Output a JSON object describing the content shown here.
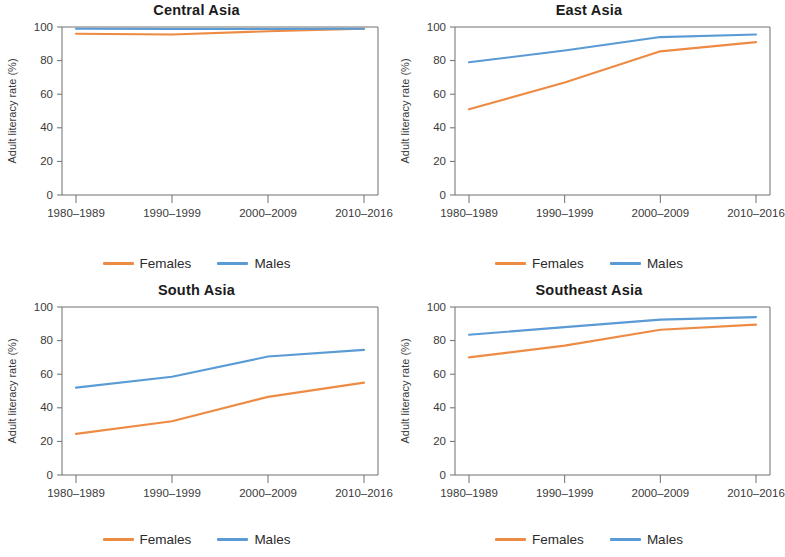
{
  "figure": {
    "y_axis_label": "Adult literacy rate (%)",
    "y_ticks": [
      "0",
      "20",
      "40",
      "60",
      "80",
      "100"
    ],
    "x_ticks": [
      "1980–1989",
      "1990–1999",
      "2000–2009",
      "2010–2016"
    ],
    "legend": {
      "females_label": "Females",
      "males_label": "Males"
    },
    "colors": {
      "females": "#ED8B44",
      "males": "#5A9BD5",
      "axis": "#6d6e71",
      "text": "#231f20",
      "background": "#ffffff"
    }
  },
  "chart_data": [
    {
      "type": "line",
      "title": "Central Asia",
      "xlabel": "",
      "ylabel": "Adult literacy rate (%)",
      "categories": [
        "1980–1989",
        "1990–1999",
        "2000–2009",
        "2010–2016"
      ],
      "ylim": [
        0,
        100
      ],
      "yticks": [
        0,
        20,
        40,
        60,
        80,
        100
      ],
      "grid": false,
      "legend_position": "bottom",
      "series": [
        {
          "name": "Females",
          "color": "#ED8B44",
          "values": [
            96,
            95.5,
            97.5,
            99
          ]
        },
        {
          "name": "Males",
          "color": "#5A9BD5",
          "values": [
            99,
            98.8,
            98.8,
            99
          ]
        }
      ]
    },
    {
      "type": "line",
      "title": "East Asia",
      "xlabel": "",
      "ylabel": "Adult literacy rate (%)",
      "categories": [
        "1980–1989",
        "1990–1999",
        "2000–2009",
        "2010–2016"
      ],
      "ylim": [
        0,
        100
      ],
      "yticks": [
        0,
        20,
        40,
        60,
        80,
        100
      ],
      "grid": false,
      "legend_position": "bottom",
      "series": [
        {
          "name": "Females",
          "color": "#ED8B44",
          "values": [
            51,
            67,
            85.5,
            91
          ]
        },
        {
          "name": "Males",
          "color": "#5A9BD5",
          "values": [
            79,
            86,
            94,
            95.5
          ]
        }
      ]
    },
    {
      "type": "line",
      "title": "South Asia",
      "xlabel": "",
      "ylabel": "Adult literacy rate (%)",
      "categories": [
        "1980–1989",
        "1990–1999",
        "2000–2009",
        "2010–2016"
      ],
      "ylim": [
        0,
        100
      ],
      "yticks": [
        0,
        20,
        40,
        60,
        80,
        100
      ],
      "grid": false,
      "legend_position": "bottom",
      "series": [
        {
          "name": "Females",
          "color": "#ED8B44",
          "values": [
            24.5,
            32,
            46.5,
            55
          ]
        },
        {
          "name": "Males",
          "color": "#5A9BD5",
          "values": [
            52,
            58.5,
            70.5,
            74.5
          ]
        }
      ]
    },
    {
      "type": "line",
      "title": "Southeast Asia",
      "xlabel": "",
      "ylabel": "Adult literacy rate (%)",
      "categories": [
        "1980–1989",
        "1990–1999",
        "2000–2009",
        "2010–2016"
      ],
      "ylim": [
        0,
        100
      ],
      "yticks": [
        0,
        20,
        40,
        60,
        80,
        100
      ],
      "grid": false,
      "legend_position": "bottom",
      "series": [
        {
          "name": "Females",
          "color": "#ED8B44",
          "values": [
            70,
            77,
            86.5,
            89.5
          ]
        },
        {
          "name": "Males",
          "color": "#5A9BD5",
          "values": [
            83.5,
            88,
            92.5,
            94
          ]
        }
      ]
    }
  ]
}
